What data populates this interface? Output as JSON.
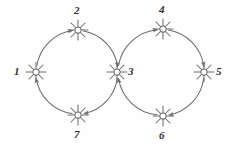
{
  "figure": {
    "background_color": "#fefefe",
    "stroke_color": "#6d6d6d",
    "label_color": "#2e2e2e",
    "width": 231,
    "height": 151
  },
  "nodes": [
    {
      "id": "n1",
      "label": "1",
      "cx": 36,
      "cy": 72,
      "label_x": 14,
      "label_y": 66,
      "glyph": "starburst-node"
    },
    {
      "id": "n2",
      "label": "2",
      "cx": 78,
      "cy": 30,
      "label_x": 74,
      "label_y": 5,
      "glyph": "starburst-node"
    },
    {
      "id": "n3",
      "label": "3",
      "cx": 117,
      "cy": 72,
      "label_x": 128,
      "label_y": 66,
      "glyph": "starburst-node"
    },
    {
      "id": "n4",
      "label": "4",
      "cx": 163,
      "cy": 29,
      "label_x": 159,
      "label_y": 4,
      "glyph": "starburst-node"
    },
    {
      "id": "n5",
      "label": "5",
      "cx": 204,
      "cy": 72,
      "label_x": 216,
      "label_y": 66,
      "glyph": "starburst-node"
    },
    {
      "id": "n6",
      "label": "6",
      "cx": 163,
      "cy": 116,
      "label_x": 159,
      "label_y": 130,
      "glyph": "starburst-node"
    },
    {
      "id": "n7",
      "label": "7",
      "cx": 78,
      "cy": 115,
      "label_x": 74,
      "label_y": 129,
      "glyph": "starburst-node"
    }
  ],
  "circles": [
    {
      "id": "left-cycle",
      "cx": 77,
      "cy": 72,
      "r": 42,
      "nodes": [
        "n1",
        "n2",
        "n3",
        "n7"
      ]
    },
    {
      "id": "right-cycle",
      "cx": 161,
      "cy": 72,
      "r": 43,
      "nodes": [
        "n3",
        "n4",
        "n5",
        "n6"
      ]
    }
  ],
  "edges": [
    {
      "id": "e1",
      "from": "n1",
      "to": "n2",
      "arrowhead": true,
      "cycle": "left-cycle"
    },
    {
      "id": "e2",
      "from": "n2",
      "to": "n3",
      "arrowhead": true,
      "cycle": "left-cycle"
    },
    {
      "id": "e3",
      "from": "n3",
      "to": "n7",
      "arrowhead": true,
      "cycle": "left-cycle"
    },
    {
      "id": "e4",
      "from": "n7",
      "to": "n1",
      "arrowhead": true,
      "cycle": "left-cycle"
    },
    {
      "id": "e5",
      "from": "n3",
      "to": "n4",
      "arrowhead": true,
      "cycle": "right-cycle"
    },
    {
      "id": "e6",
      "from": "n4",
      "to": "n5",
      "arrowhead": true,
      "cycle": "right-cycle"
    },
    {
      "id": "e7",
      "from": "n5",
      "to": "n6",
      "arrowhead": true,
      "cycle": "right-cycle"
    },
    {
      "id": "e8",
      "from": "n6",
      "to": "n3",
      "arrowhead": true,
      "cycle": "right-cycle"
    }
  ]
}
